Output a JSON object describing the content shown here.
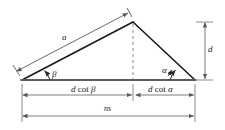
{
  "figure": {
    "type": "geometry-diagram",
    "width": 225,
    "height": 130,
    "background_color": "#ffffff",
    "stroke_color": "#1a1a1a",
    "dimension_color": "#6e6e6e",
    "dashed_color": "#8a8a8a"
  },
  "labels": {
    "side_a": "a",
    "angle_beta": "β",
    "angle_alpha": "α",
    "height_d": "d",
    "base_left": {
      "prefix": "d",
      "operator": "cot",
      "symbol": "β"
    },
    "base_right": {
      "prefix": "d",
      "operator": "cot",
      "symbol": "α"
    },
    "base_total": "ns"
  },
  "geometry": {
    "apex": {
      "x": 133,
      "y": 22
    },
    "left_vertex": {
      "x": 22,
      "y": 80
    },
    "right_vertex": {
      "x": 195,
      "y": 80
    },
    "foot": {
      "x": 133,
      "y": 80
    },
    "height_dimension_x": 205,
    "base_dimension_y": 95,
    "total_dimension_y": 116
  }
}
